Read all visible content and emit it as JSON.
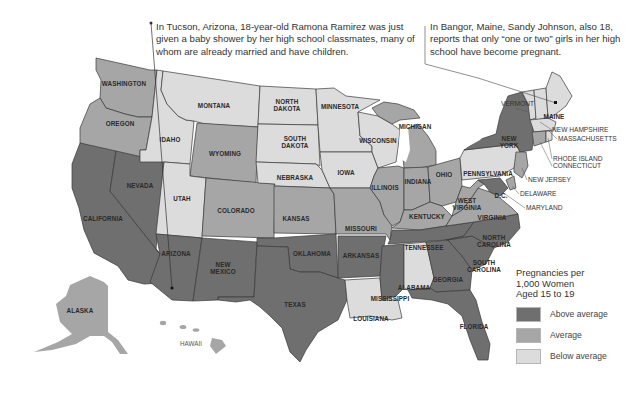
{
  "callouts": {
    "left": "In Tucson, Arizona, 18-year-old Ramona Ramirez was just given a baby shower by her high school classmates, many of whom are already married and have children.",
    "right": "In Bangor, Maine, Sandy Johnson, also 18, reports that only “one or two” girls in her high school have become pregnant."
  },
  "legend": {
    "title_line1": "Pregnancies per",
    "title_line2": "1,000 Women",
    "title_line3": "Aged 15 to 19",
    "items": [
      {
        "label": "Above average",
        "color": "#6f6f6f"
      },
      {
        "label": "Average",
        "color": "#a6a6a6"
      },
      {
        "label": "Below average",
        "color": "#dcdcdc"
      }
    ]
  },
  "colors": {
    "above": "#6f6f6f",
    "average": "#a6a6a6",
    "below": "#dcdcdc"
  },
  "states": {
    "washington": {
      "label": "WASHINGTON",
      "category": "Average"
    },
    "oregon": {
      "label": "OREGON",
      "category": "Average"
    },
    "california": {
      "label": "CALIFORNIA",
      "category": "Above average"
    },
    "nevada": {
      "label": "NEVADA",
      "category": "Above average"
    },
    "idaho": {
      "label": "IDAHO",
      "category": "Below average"
    },
    "montana": {
      "label": "MONTANA",
      "category": "Below average"
    },
    "wyoming": {
      "label": "WYOMING",
      "category": "Average"
    },
    "utah": {
      "label": "UTAH",
      "category": "Below average"
    },
    "colorado": {
      "label": "COLORADO",
      "category": "Average"
    },
    "arizona": {
      "label": "ARIZONA",
      "category": "Above average"
    },
    "new_mexico_1": {
      "label": "NEW",
      "category": "Above average"
    },
    "new_mexico_2": {
      "label": "MEXICO"
    },
    "north_dakota_1": {
      "label": "NORTH",
      "category": "Below average"
    },
    "north_dakota_2": {
      "label": "DAKOTA"
    },
    "south_dakota_1": {
      "label": "SOUTH",
      "category": "Below average"
    },
    "south_dakota_2": {
      "label": "DAKOTA"
    },
    "nebraska": {
      "label": "NEBRASKA",
      "category": "Below average"
    },
    "kansas": {
      "label": "KANSAS",
      "category": "Average"
    },
    "oklahoma": {
      "label": "OKLAHOMA",
      "category": "Above average"
    },
    "texas": {
      "label": "TEXAS",
      "category": "Above average"
    },
    "minnesota": {
      "label": "MINNESOTA",
      "category": "Below average"
    },
    "iowa": {
      "label": "IOWA",
      "category": "Below average"
    },
    "missouri": {
      "label": "MISSOURI",
      "category": "Average"
    },
    "arkansas": {
      "label": "ARKANSAS",
      "category": "Above average"
    },
    "louisiana": {
      "label": "LOUISIANA",
      "category": "Below average"
    },
    "wisconsin": {
      "label": "WISCONSIN",
      "category": "Below average"
    },
    "illinois": {
      "label": "ILLINOIS",
      "category": "Average"
    },
    "michigan": {
      "label": "MICHIGAN",
      "category": "Average"
    },
    "indiana": {
      "label": "INDIANA",
      "category": "Average"
    },
    "ohio": {
      "label": "OHIO",
      "category": "Average"
    },
    "kentucky": {
      "label": "KENTUCKY",
      "category": "Average"
    },
    "tennessee": {
      "label": "TENNESSEE",
      "category": "Above average"
    },
    "mississippi": {
      "label": "MISSISSIPPI",
      "category": "Above average"
    },
    "alabama": {
      "label": "ALABAMA",
      "category": "Below average"
    },
    "georgia": {
      "label": "GEORGIA",
      "category": "Above average"
    },
    "florida": {
      "label": "FLORIDA",
      "category": "Above average"
    },
    "south_carolina_1": {
      "label": "SOUTH",
      "category": "Above average"
    },
    "south_carolina_2": {
      "label": "CAROLINA"
    },
    "north_carolina_1": {
      "label": "NORTH",
      "category": "Above average"
    },
    "north_carolina_2": {
      "label": "CAROLINA"
    },
    "virginia": {
      "label": "VIRGINIA",
      "category": "Average"
    },
    "west_virginia_1": {
      "label": "WEST",
      "category": "Average"
    },
    "west_virginia_2": {
      "label": "VIRGINIA"
    },
    "dc": {
      "label": "D.C.",
      "category": "Above average"
    },
    "pennsylvania": {
      "label": "PENNSYLVANIA",
      "category": "Below average"
    },
    "new_york_1": {
      "label": "NEW",
      "category": "Above average"
    },
    "new_york_2": {
      "label": "YORK"
    },
    "new_jersey": {
      "label": "NEW JERSEY",
      "category": "Average"
    },
    "delaware": {
      "label": "DELAWARE",
      "category": "Average"
    },
    "maryland": {
      "label": "MARYLAND",
      "category": "Average"
    },
    "vermont": {
      "label": "VERMONT",
      "category": "Below average"
    },
    "maine": {
      "label": "MAINE",
      "category": "Below average"
    },
    "new_hampshire": {
      "label": "NEW HAMPSHIRE",
      "category": "Below average"
    },
    "massachusetts": {
      "label": "MASSACHUSETTS",
      "category": "Below average"
    },
    "rhode_island": {
      "label": "RHODE ISLAND",
      "category": "Below average"
    },
    "connecticut": {
      "label": "CONNECTICUT",
      "category": "Average"
    },
    "alaska": {
      "label": "ALASKA",
      "category": "Average"
    },
    "hawaii": {
      "label": "HAWAII",
      "category": "Average"
    }
  }
}
